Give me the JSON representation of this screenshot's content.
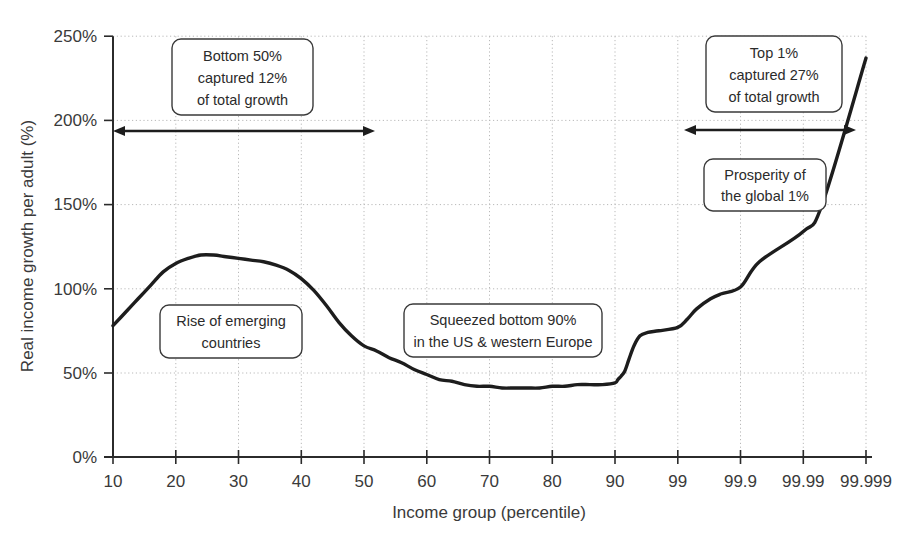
{
  "chart_data": {
    "type": "line",
    "title": "",
    "subtitle": "",
    "xlabel": "Income group (percentile)",
    "ylabel": "Real income growth per adult (%)",
    "xticklabels": [
      "10",
      "20",
      "30",
      "40",
      "50",
      "60",
      "70",
      "80",
      "90",
      "99",
      "99.9",
      "99.99",
      "99.999"
    ],
    "yticklabels": [
      "0%",
      "50%",
      "100%",
      "150%",
      "200%",
      "250%"
    ],
    "ytickvalues": [
      0,
      50,
      100,
      150,
      200,
      250
    ],
    "ylim": [
      0,
      250
    ],
    "grid": true,
    "legend_position": "none",
    "x_scale": "ordinal-percentile",
    "series": [
      {
        "name": "Real income growth per adult",
        "x": [
          "10",
          "12",
          "14",
          "16",
          "18",
          "20",
          "22",
          "24",
          "26",
          "28",
          "30",
          "32",
          "34",
          "36",
          "38",
          "40",
          "42",
          "44",
          "46",
          "48",
          "50",
          "52",
          "54",
          "56",
          "58",
          "60",
          "62",
          "64",
          "66",
          "68",
          "70",
          "72",
          "74",
          "76",
          "78",
          "80",
          "82",
          "84",
          "86",
          "88",
          "90",
          "91",
          "92",
          "93",
          "94",
          "95",
          "96",
          "97",
          "98",
          "99",
          "99.3",
          "99.5",
          "99.7",
          "99.8",
          "99.9",
          "99.95",
          "99.99",
          "99.995",
          "99.999"
        ],
        "values": [
          78,
          86,
          94,
          102,
          110,
          115,
          118,
          120,
          120,
          119,
          118,
          117,
          116,
          114,
          111,
          106,
          99,
          90,
          80,
          72,
          66,
          63,
          59,
          56,
          52,
          49,
          46,
          45,
          43,
          42,
          42,
          41,
          41,
          41,
          41,
          42,
          42,
          43,
          43,
          43,
          44,
          46,
          48,
          51,
          58,
          66,
          72,
          74,
          75,
          77,
          82,
          88,
          94,
          97,
          101,
          116,
          134,
          150,
          237
        ]
      }
    ],
    "annotations": [
      {
        "id": "bottom-50",
        "lines": [
          "Bottom 50%",
          "captured 12%",
          "of total growth"
        ],
        "type": "callout-box"
      },
      {
        "id": "top-1",
        "lines": [
          "Top 1%",
          "captured 27%",
          "of total growth"
        ],
        "type": "callout-box"
      },
      {
        "id": "rise-emerging",
        "lines": [
          "Rise of emerging",
          "countries"
        ],
        "type": "callout-box"
      },
      {
        "id": "squeezed-bottom-90",
        "lines": [
          "Squeezed bottom 90%",
          "in the US & western Europe"
        ],
        "type": "callout-box"
      },
      {
        "id": "prosperity-global-1",
        "lines": [
          "Prosperity of",
          "the global 1%"
        ],
        "type": "callout-box"
      }
    ],
    "span_arrows": [
      {
        "id": "bottom-50-span",
        "from": "10",
        "to": "50",
        "y_value": 195
      },
      {
        "id": "top-1-span",
        "from": "99",
        "to": "99.999",
        "y_value": 196
      }
    ],
    "colors": {
      "line": "#1d1d1d",
      "grid": "#b9b9b9",
      "axis": "#2b2b2b",
      "text": "#3a3a3a",
      "background": "#ffffff",
      "callout_border": "#3a3a3a"
    }
  },
  "axis": {
    "x_title": "Income group (percentile)",
    "y_title": "Real income growth per adult (%)"
  },
  "y_ticks": [
    {
      "label": "250%"
    },
    {
      "label": "200%"
    },
    {
      "label": "150%"
    },
    {
      "label": "100%"
    },
    {
      "label": "50%"
    },
    {
      "label": "0%"
    }
  ],
  "x_ticks": [
    {
      "label": "10"
    },
    {
      "label": "20"
    },
    {
      "label": "30"
    },
    {
      "label": "40"
    },
    {
      "label": "50"
    },
    {
      "label": "60"
    },
    {
      "label": "70"
    },
    {
      "label": "80"
    },
    {
      "label": "90"
    },
    {
      "label": "99"
    },
    {
      "label": "99.9"
    },
    {
      "label": "99.99"
    },
    {
      "label": "99.999"
    }
  ],
  "callouts": {
    "bottom50": {
      "line1": "Bottom 50%",
      "line2": "captured 12%",
      "line3": "of total growth"
    },
    "top1": {
      "line1": "Top 1%",
      "line2": "captured 27%",
      "line3": "of total growth"
    },
    "emerging": {
      "line1": "Rise of emerging",
      "line2": "countries"
    },
    "squeezed": {
      "line1": "Squeezed bottom 90%",
      "line2": "in the US & western Europe"
    },
    "prosperity": {
      "line1": "Prosperity of",
      "line2": "the global 1%"
    }
  }
}
